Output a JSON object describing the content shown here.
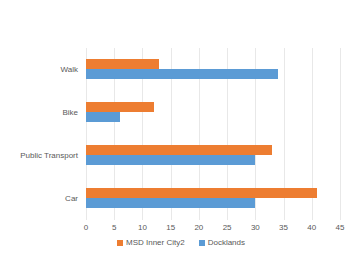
{
  "chart_data": {
    "type": "bar",
    "orientation": "horizontal",
    "title": "",
    "xlabel": "",
    "ylabel": "",
    "categories": [
      "Walk",
      "Bike",
      "Public Transport",
      "Car"
    ],
    "series": [
      {
        "name": "MSD Inner City2",
        "color": "#ed7d31",
        "values": [
          13,
          12,
          33,
          41
        ]
      },
      {
        "name": "Docklands",
        "color": "#5b9bd5",
        "values": [
          34,
          6,
          30,
          30
        ]
      }
    ],
    "xlim": [
      0,
      45
    ],
    "xticks": [
      0,
      5,
      10,
      15,
      20,
      25,
      30,
      35,
      40,
      45
    ],
    "xtick_labels": [
      "0",
      "5",
      "10",
      "15",
      "20",
      "25",
      "30",
      "35",
      "40",
      "45"
    ],
    "grid": true,
    "grid_axis": "x",
    "grid_color": "#e8e8e8",
    "legend_position": "bottom",
    "background": "#ffffff",
    "text_color": "#595959"
  }
}
